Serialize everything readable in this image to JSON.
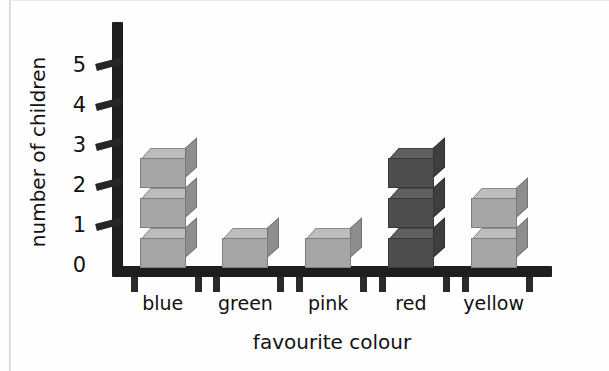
{
  "chart_data": {
    "type": "bar",
    "title": "",
    "subtitle": "",
    "xlabel": "favourite colour",
    "ylabel": "number of children",
    "categories": [
      "blue",
      "green",
      "pink",
      "red",
      "yellow"
    ],
    "values": [
      3,
      1,
      1,
      3,
      2
    ],
    "ytick_labels": [
      "0",
      "1",
      "2",
      "3",
      "4",
      "5"
    ],
    "ylim": [
      0,
      5
    ],
    "grid": false,
    "legend": false,
    "style": "3d-stacked-cubes",
    "series": [
      {
        "name": "number of children",
        "points": [
          {
            "category": "blue",
            "value": 3,
            "shade": "light"
          },
          {
            "category": "green",
            "value": 1,
            "shade": "light"
          },
          {
            "category": "pink",
            "value": 1,
            "shade": "light"
          },
          {
            "category": "red",
            "value": 3,
            "shade": "dark"
          },
          {
            "category": "yellow",
            "value": 2,
            "shade": "light"
          }
        ]
      }
    ]
  },
  "colors": {
    "axis": "#1e1e1e",
    "text": "#111111",
    "bar_light_front": "#a6a6a6",
    "bar_light_top": "#bdbdbd",
    "bar_light_side": "#8e8e8e",
    "bar_dark_front": "#4d4d4d",
    "bar_dark_top": "#606060",
    "bar_dark_side": "#3e3e3e",
    "background": "#fefefe"
  },
  "axis": {
    "y_title": "number of children",
    "x_title": "favourite colour",
    "y_ticks": [
      "0",
      "1",
      "2",
      "3",
      "4",
      "5"
    ],
    "x_categories": [
      "blue",
      "green",
      "pink",
      "red",
      "yellow"
    ]
  }
}
